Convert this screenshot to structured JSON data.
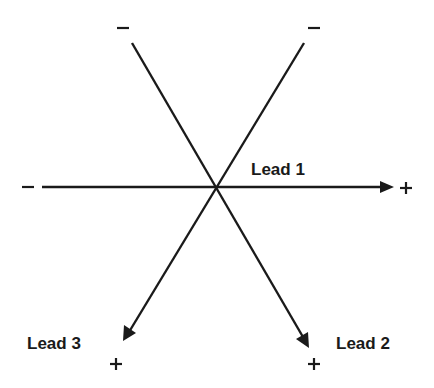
{
  "diagram": {
    "type": "einthoven-triangle-lead-axes",
    "colors": {
      "ink": "#1a1a1a",
      "background": "#ffffff"
    },
    "leads": [
      {
        "id": "lead1",
        "label": "Lead 1",
        "angle_deg": 0,
        "negative_sign": "−",
        "positive_sign": "+"
      },
      {
        "id": "lead2",
        "label": "Lead 2",
        "angle_deg": 60,
        "negative_sign": "−",
        "positive_sign": "+"
      },
      {
        "id": "lead3",
        "label": "Lead 3",
        "angle_deg": 120,
        "negative_sign": "−",
        "positive_sign": "+"
      }
    ]
  }
}
